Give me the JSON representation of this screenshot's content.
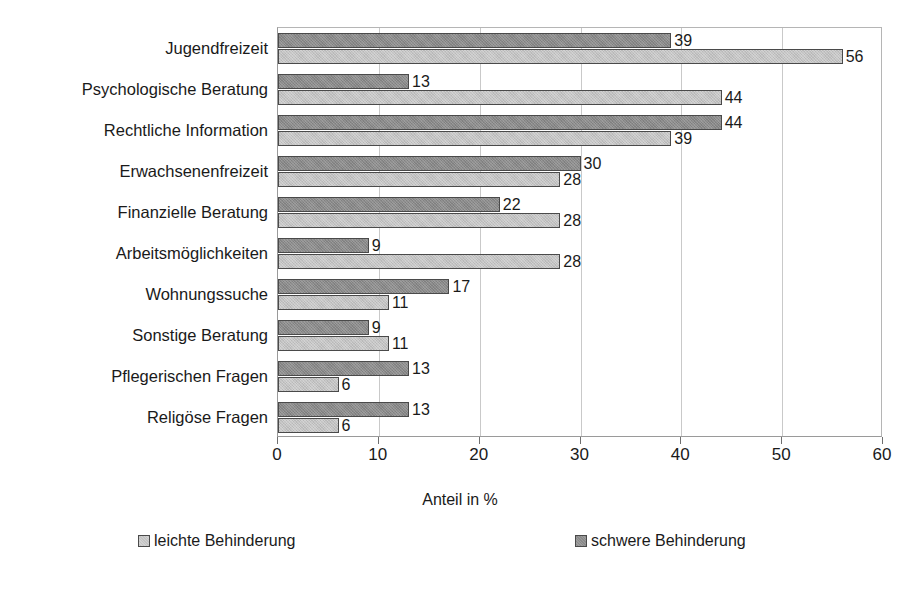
{
  "chart_data": {
    "type": "bar",
    "orientation": "horizontal",
    "title": "",
    "xlabel": "Anteil in %",
    "ylabel": "",
    "xlim": [
      0,
      60
    ],
    "xticks": [
      "0",
      "10",
      "20",
      "30",
      "40",
      "50",
      "60"
    ],
    "grid": "vertical",
    "legend_position": "bottom",
    "categories": [
      "Jugendfreizeit",
      "Psychologische Beratung",
      "Rechtliche Information",
      "Erwachsenenfreizeit",
      "Finanzielle Beratung",
      "Arbeitsmöglichkeiten",
      "Wohnungssuche",
      "Sonstige Beratung",
      "Pflegerischen Fragen",
      "Religöse Fragen"
    ],
    "series": [
      {
        "name": "schwere Behinderung",
        "color": "#8a8a8a",
        "values": [
          39,
          13,
          44,
          30,
          22,
          9,
          17,
          9,
          13,
          13
        ]
      },
      {
        "name": "leichte Behinderung",
        "color": "#c3c3c3",
        "values": [
          56,
          44,
          39,
          28,
          28,
          28,
          11,
          11,
          6,
          6
        ]
      }
    ]
  },
  "legend": {
    "items": [
      {
        "label": "leichte Behinderung",
        "swatch": "mild"
      },
      {
        "label": "schwere Behinderung",
        "swatch": "severe"
      }
    ]
  },
  "axis": {
    "title": "Anteil in %"
  }
}
